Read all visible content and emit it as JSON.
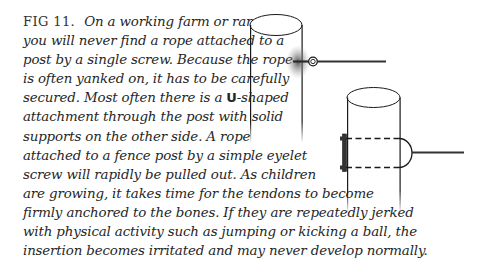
{
  "figure": {
    "label": "FIG 11.",
    "lines": [
      "On a working farm or ranch",
      "you will never find a rope attached to a",
      "post by a single screw. Because the rope",
      "is often yanked on, it has to be carefully",
      "secured. Most often there is a ",
      "attachment through the post with solid",
      "supports on the other side. A rope",
      "attached to a fence post by a simple eyelet",
      "screw will rapidly be pulled out. As children",
      "are growing, it takes time for the tendons to become",
      "firmly anchored to the bones. If they are repeatedly jerked",
      "with physical activity such as jumping or kicking a ball, the",
      "insertion becomes irritated and may never develop normally."
    ],
    "u_letter": "U",
    "u_suffix": "-shaped"
  },
  "illustration": {
    "post_a": {
      "description": "fence post with single eyelet screw",
      "icon": "eyelet-screw-icon"
    },
    "post_b": {
      "description": "fence post with U-shaped attachment and backing plate",
      "icon": "u-bolt-icon"
    },
    "colors": {
      "line": "#1a1a1a",
      "rope": "#333333",
      "shadow": "#555555",
      "text": "#262626"
    }
  }
}
